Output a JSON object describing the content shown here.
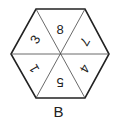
{
  "figure": {
    "label": "B",
    "shape": "hexagon",
    "segments": [
      {
        "position": "top",
        "value": "8",
        "rotation": 0
      },
      {
        "position": "upper-right",
        "value": "7",
        "rotation": 120
      },
      {
        "position": "lower-right",
        "value": "4",
        "rotation": 120
      },
      {
        "position": "bottom",
        "value": "5",
        "rotation": 180
      },
      {
        "position": "lower-left",
        "value": "1",
        "rotation": 240
      },
      {
        "position": "upper-left",
        "value": "3",
        "rotation": 300
      }
    ],
    "colors": {
      "stroke": "#222222",
      "background": "#ffffff"
    }
  }
}
